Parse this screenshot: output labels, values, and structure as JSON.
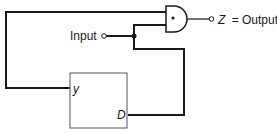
{
  "diagram": {
    "input_label": "Input",
    "output_label": "Z = Output",
    "output_var": "Z",
    "output_eq": "= Output",
    "gate": {
      "type": "AND",
      "symbol": "•"
    },
    "block": {
      "port_y": "y",
      "port_d": "D"
    },
    "colors": {
      "line": "#1a1a1a",
      "box": "#555555",
      "background": "#ffffff"
    }
  }
}
